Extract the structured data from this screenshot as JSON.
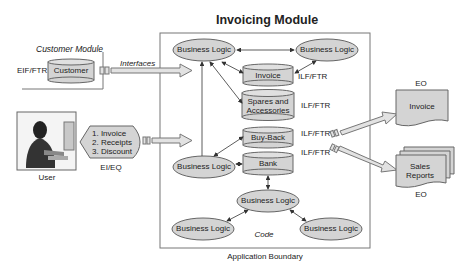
{
  "title": "Invoicing Module",
  "customer_module": {
    "title": "Customer Module",
    "eif_label": "EIF/FTR",
    "store": "Customer"
  },
  "interfaces_label": "Interfaces",
  "user": {
    "label": "User",
    "inputs": [
      "1. Invoice",
      "2. Receipts",
      "3. Discount"
    ],
    "input_type": "EI/EQ"
  },
  "invoicing": {
    "business_logic": "Business Logic",
    "stores": {
      "invoice": "Invoice",
      "spares_line1": "Spares and",
      "spares_line2": "Accessories",
      "buyback": "Buy-Back",
      "bank": "Bank"
    },
    "ilf_label": "ILF/FTR",
    "code_label": "Code",
    "boundary_label": "Application Boundary"
  },
  "outputs": {
    "eo_label": "EO",
    "invoice": "Invoice",
    "sales_line1": "Sales",
    "sales_line2": "Reports"
  },
  "colors": {
    "shape_fill": "#d4d4d4",
    "stroke": "#666666",
    "arrow_fill": "#e2e2e2",
    "text": "#222222"
  }
}
